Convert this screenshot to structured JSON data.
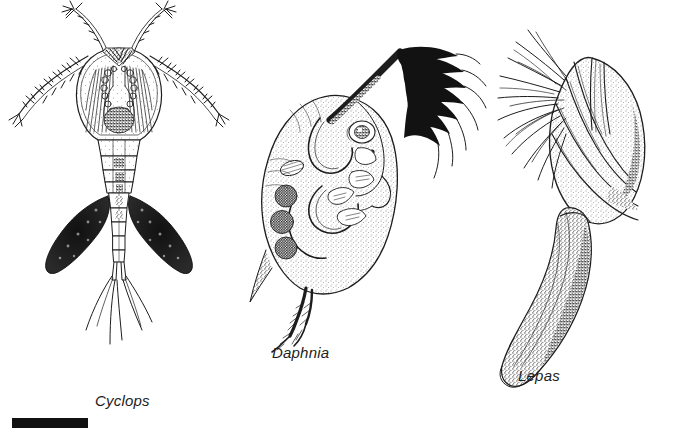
{
  "figure": {
    "kind": "scientific-line-illustration",
    "background_color": "#ffffff",
    "ink_color": "#1d1d1d",
    "labels": [
      {
        "id": "cyclops",
        "text": "Cyclops",
        "style": "italic"
      },
      {
        "id": "daphnia",
        "text": "Daphnia",
        "style": "italic"
      },
      {
        "id": "lepas",
        "text": "Lepas",
        "style": "italic"
      }
    ],
    "scale_bar": {
      "color": "#111111",
      "width_px": 76,
      "height_px": 10,
      "caption": ""
    },
    "specimens": [
      {
        "name": "Cyclops",
        "orientation": "dorsal view, head up",
        "parts": [
          "antennae",
          "head shield",
          "thorax segments",
          "egg sacs",
          "abdomen",
          "caudal setae"
        ],
        "egg_sac_count": 2
      },
      {
        "name": "Daphnia",
        "orientation": "lateral view, facing right",
        "parts": [
          "carapace",
          "compound eye",
          "antenna",
          "gut",
          "brood eggs",
          "post-abdomen",
          "apical spine"
        ],
        "egg_count": 3
      },
      {
        "name": "Lepas",
        "orientation": "lateral view, capitulum up",
        "parts": [
          "capitulum plates",
          "cirri",
          "peduncle"
        ],
        "cirri_description": "long curved feeding cirri"
      }
    ]
  }
}
